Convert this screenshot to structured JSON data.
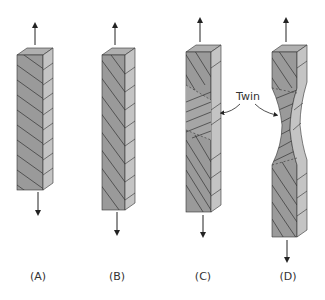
{
  "diagram": {
    "panels": [
      {
        "id": "A",
        "label": "(A)",
        "description": "Single crystal under tension, slip planes inclined"
      },
      {
        "id": "B",
        "label": "(B)",
        "description": "Crystal after slip, slip planes rotated toward tensile axis"
      },
      {
        "id": "C",
        "label": "(C)",
        "description": "Crystal with twinned region in middle"
      },
      {
        "id": "D",
        "label": "(D)",
        "description": "Necked crystal with twinned region"
      }
    ],
    "annotation": {
      "text": "Twin"
    },
    "colors": {
      "front_face": "#9a9a9a",
      "side_face": "#c4c4c4",
      "top_face": "#b0b0b0",
      "lines": "#333333",
      "arrow": "#222222"
    }
  }
}
